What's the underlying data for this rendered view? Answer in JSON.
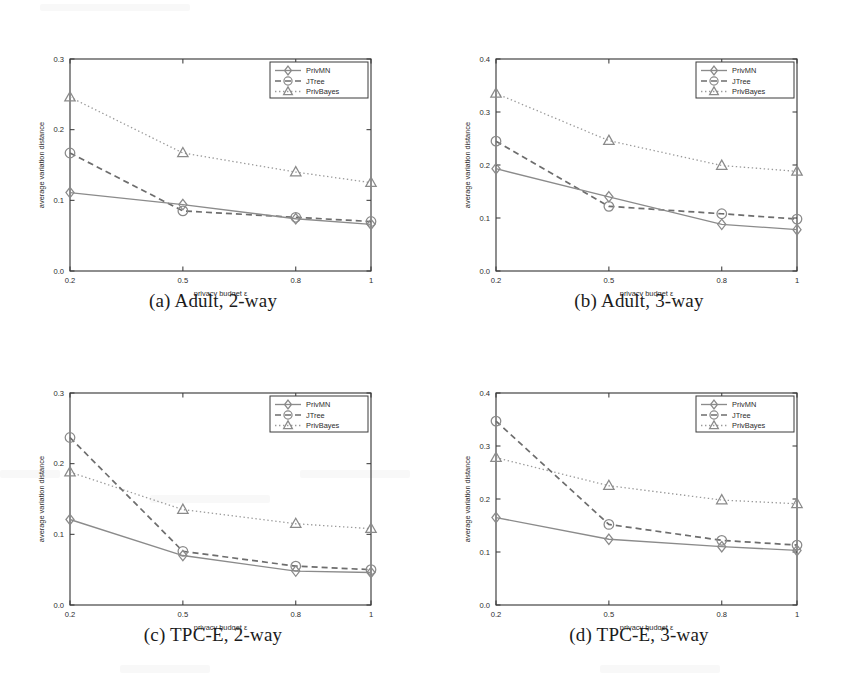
{
  "figure": {
    "xlabel": "privacy budget ε",
    "ylabel": "average variation distance",
    "xticks": [
      "0.2",
      "0.5",
      "0.8",
      "1"
    ],
    "legend": [
      {
        "label": "PrivMN",
        "marker": "diamond",
        "line": "solid"
      },
      {
        "label": "JTree",
        "marker": "circle",
        "line": "dashed"
      },
      {
        "label": "PrivBayes",
        "marker": "triangle",
        "line": "dotted"
      }
    ],
    "colors": {
      "solid": "#8b8b8b",
      "dashed": "#6d6d6d",
      "dotted": "#9a9a9a",
      "axis": "#3b3b3b",
      "text": "#2b2b2b",
      "background": "#ffffff"
    }
  },
  "panels": [
    {
      "id": "a",
      "caption": "(a) Adult, 2-way",
      "yticks": [
        "0.0",
        "0.1",
        "0.2",
        "0.3"
      ],
      "chart_data": {
        "type": "line",
        "title": "(a) Adult, 2-way",
        "xlabel": "privacy budget ε",
        "ylabel": "average variation distance",
        "x": [
          0.2,
          0.5,
          0.8,
          1.0
        ],
        "xtick_labels": [
          "0.2",
          "0.5",
          "0.8",
          "1"
        ],
        "ylim": [
          0.0,
          0.3
        ],
        "ytick_values": [
          0.0,
          0.1,
          0.2,
          0.3
        ],
        "ytick_labels": [
          "0.0",
          "0.1",
          "0.2",
          "0.3"
        ],
        "grid": false,
        "legend_position": "top-right",
        "series": [
          {
            "name": "PrivMN",
            "values": [
              0.111,
              0.094,
              0.074,
              0.066
            ]
          },
          {
            "name": "JTree",
            "values": [
              0.167,
              0.085,
              0.076,
              0.07
            ]
          },
          {
            "name": "PrivBayes",
            "values": [
              0.246,
              0.167,
              0.14,
              0.125
            ]
          }
        ]
      }
    },
    {
      "id": "b",
      "caption": "(b) Adult, 3-way",
      "yticks": [
        "0.0",
        "0.1",
        "0.2",
        "0.3",
        "0.4"
      ],
      "chart_data": {
        "type": "line",
        "title": "(b) Adult, 3-way",
        "xlabel": "privacy budget ε",
        "ylabel": "average variation distance",
        "x": [
          0.2,
          0.5,
          0.8,
          1.0
        ],
        "xtick_labels": [
          "0.2",
          "0.5",
          "0.8",
          "1"
        ],
        "ylim": [
          0.0,
          0.4
        ],
        "ytick_values": [
          0.0,
          0.1,
          0.2,
          0.3,
          0.4
        ],
        "ytick_labels": [
          "0.0",
          "0.1",
          "0.2",
          "0.3",
          "0.4"
        ],
        "grid": false,
        "legend_position": "top-right",
        "series": [
          {
            "name": "PrivMN",
            "values": [
              0.193,
              0.14,
              0.088,
              0.078
            ]
          },
          {
            "name": "JTree",
            "values": [
              0.245,
              0.122,
              0.108,
              0.098
            ]
          },
          {
            "name": "PrivBayes",
            "values": [
              0.335,
              0.246,
              0.199,
              0.188
            ]
          }
        ]
      }
    },
    {
      "id": "c",
      "caption": "(c) TPC-E, 2-way",
      "yticks": [
        "0.0",
        "0.1",
        "0.2",
        "0.3"
      ],
      "chart_data": {
        "type": "line",
        "title": "(c) TPC-E, 2-way",
        "xlabel": "privacy budget ε",
        "ylabel": "average variation distance",
        "x": [
          0.2,
          0.5,
          0.8,
          1.0
        ],
        "xtick_labels": [
          "0.2",
          "0.5",
          "0.8",
          "1"
        ],
        "ylim": [
          0.0,
          0.3
        ],
        "ytick_values": [
          0.0,
          0.1,
          0.2,
          0.3
        ],
        "ytick_labels": [
          "0.0",
          "0.1",
          "0.2",
          "0.3"
        ],
        "grid": false,
        "legend_position": "top-right",
        "series": [
          {
            "name": "PrivMN",
            "values": [
              0.121,
              0.07,
              0.048,
              0.046
            ]
          },
          {
            "name": "JTree",
            "values": [
              0.237,
              0.076,
              0.055,
              0.05
            ]
          },
          {
            "name": "PrivBayes",
            "values": [
              0.188,
              0.135,
              0.115,
              0.108
            ]
          }
        ]
      }
    },
    {
      "id": "d",
      "caption": "(d) TPC-E, 3-way",
      "yticks": [
        "0.0",
        "0.1",
        "0.2",
        "0.3",
        "0.4"
      ],
      "chart_data": {
        "type": "line",
        "title": "(d) TPC-E, 3-way",
        "xlabel": "privacy budget ε",
        "ylabel": "average variation distance",
        "x": [
          0.2,
          0.5,
          0.8,
          1.0
        ],
        "xtick_labels": [
          "0.2",
          "0.5",
          "0.8",
          "1"
        ],
        "ylim": [
          0.0,
          0.4
        ],
        "ytick_values": [
          0.0,
          0.1,
          0.2,
          0.3,
          0.4
        ],
        "ytick_labels": [
          "0.0",
          "0.1",
          "0.2",
          "0.3",
          "0.4"
        ],
        "grid": false,
        "legend_position": "top-right",
        "series": [
          {
            "name": "PrivMN",
            "values": [
              0.165,
              0.124,
              0.11,
              0.103
            ]
          },
          {
            "name": "JTree",
            "values": [
              0.347,
              0.152,
              0.122,
              0.113
            ]
          },
          {
            "name": "PrivBayes",
            "values": [
              0.278,
              0.225,
              0.198,
              0.191
            ]
          }
        ]
      }
    }
  ]
}
